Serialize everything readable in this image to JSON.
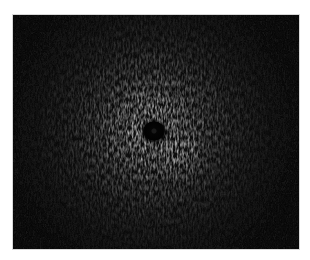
{
  "image": {
    "type": "radial-ultrasound-scan",
    "description": "Grayscale circular speckle scan with dark central catheter and bright surrounding halo",
    "frame": {
      "x": 12,
      "y": 14,
      "width": 288,
      "height": 236
    },
    "center": {
      "x": 141,
      "y": 116
    },
    "catheter_radius": 10,
    "hotspot": {
      "x": 165,
      "y": 137
    },
    "colors": {
      "background": "#ffffff",
      "frame": "#0a0a0a",
      "halo": "#f2f2f2",
      "catheter": "#030303",
      "border": "#d8d8d8"
    }
  }
}
